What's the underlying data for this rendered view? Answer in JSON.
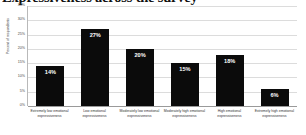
{
  "chart_data": {
    "type": "bar",
    "title": "Expressiveness across the survey",
    "xlabel": "",
    "ylabel": "Percent of respondents",
    "ylim": [
      0,
      35
    ],
    "grid": true,
    "legend": "none",
    "categories": [
      "Extremely low emotional expressiveness",
      "Low emotional expressiveness",
      "Moderately low emotional expressiveness",
      "Moderately high emotional expressiveness",
      "High emotional expressiveness",
      "Extremely high emotional expressiveness"
    ],
    "values": [
      14,
      27,
      20,
      15,
      18,
      6
    ],
    "data_labels": [
      "14%",
      "27%",
      "20%",
      "15%",
      "18%",
      "6%"
    ],
    "y_ticks": [
      {
        "value": 35,
        "label": "35%"
      },
      {
        "value": 30,
        "label": "30%"
      },
      {
        "value": 25,
        "label": "25%"
      },
      {
        "value": 20,
        "label": "20%"
      },
      {
        "value": 15,
        "label": "15%"
      },
      {
        "value": 10,
        "label": "10%"
      },
      {
        "value": 5,
        "label": "5%"
      },
      {
        "value": 0,
        "label": "0%"
      }
    ],
    "colors": {
      "bar": "#0b0b0b",
      "data_label": "#ffffff",
      "gridline": "#dcdcdc",
      "axis": "#9a9a9a",
      "background": "#ffffff"
    }
  }
}
